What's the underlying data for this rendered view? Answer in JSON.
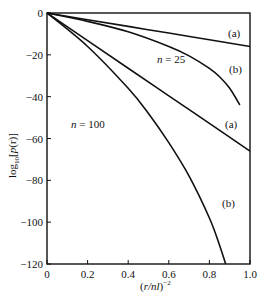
{
  "chart_data": {
    "type": "line",
    "title": "",
    "xlabel": "(r/nl)^-2",
    "xlabel_parts": {
      "open": "(",
      "var": "r/nl",
      "close": ")",
      "sup": "-2"
    },
    "ylabel": "log10[p(r)]",
    "ylabel_parts": {
      "pre": "log",
      "sub": "10",
      "mid": "[",
      "var": "p",
      "args": "(r)",
      "close": "]"
    },
    "xlim": [
      0,
      1.0
    ],
    "ylim": [
      -120,
      0
    ],
    "xticks": [
      0,
      0.2,
      0.4,
      0.6,
      0.8,
      1.0
    ],
    "xtick_labels": [
      "0",
      "0.2",
      "0.4",
      "0.6",
      "0.8",
      "1.0"
    ],
    "yticks": [
      0,
      -20,
      -40,
      -60,
      -80,
      -100,
      -120
    ],
    "ytick_labels": [
      "0",
      "−20",
      "−40",
      "−60",
      "−80",
      "−100",
      "−120"
    ],
    "grid": false,
    "legend": null,
    "series": [
      {
        "name": "n = 25 (a)",
        "group": "n = 25",
        "variant": "(a)",
        "x": [
          0,
          0.2,
          0.4,
          0.6,
          0.8,
          1.0
        ],
        "y": [
          0,
          -3.2,
          -6.4,
          -9.6,
          -12.8,
          -16
        ]
      },
      {
        "name": "n = 25 (b)",
        "group": "n = 25",
        "variant": "(b)",
        "x": [
          0,
          0.2,
          0.4,
          0.6,
          0.7,
          0.8,
          0.85,
          0.9,
          0.95
        ],
        "y": [
          0,
          -4,
          -9,
          -16,
          -20.5,
          -26.5,
          -30.5,
          -36,
          -44
        ]
      },
      {
        "name": "n = 100 (a)",
        "group": "n = 100",
        "variant": "(a)",
        "x": [
          0,
          0.2,
          0.4,
          0.6,
          0.8,
          1.0
        ],
        "y": [
          0,
          -13.2,
          -26.4,
          -39.6,
          -52.8,
          -66
        ]
      },
      {
        "name": "n = 100 (b)",
        "group": "n = 100",
        "variant": "(b)",
        "x": [
          0,
          0.2,
          0.4,
          0.5,
          0.6,
          0.7,
          0.8,
          0.85,
          0.88
        ],
        "y": [
          0,
          -16,
          -36,
          -48,
          -62,
          -78,
          -98,
          -111,
          -120
        ]
      }
    ],
    "annotations": [
      {
        "text": "(a)",
        "x": 0.93,
        "y": -7.5,
        "series": "n = 25 (a)"
      },
      {
        "text": "n = 25",
        "x": 0.62,
        "y": -22,
        "italic_part": "n"
      },
      {
        "text": "(b)",
        "x": 0.93,
        "y": -28,
        "series": "n = 25 (b)"
      },
      {
        "text": "(a)",
        "x": 0.87,
        "y": -58,
        "series": "n = 100 (a)"
      },
      {
        "text": "n = 100",
        "x": 0.25,
        "y": -53,
        "italic_part": "n"
      },
      {
        "text": "(b)",
        "x": 0.76,
        "y": -95,
        "series": "n = 100 (b)"
      }
    ]
  },
  "labels": {
    "ann_25a": "(a)",
    "ann_25_n": "n",
    "ann_25_eq": " = 25",
    "ann_25b": "(b)",
    "ann_100a": "(a)",
    "ann_100_n": "n",
    "ann_100_eq": " = 100",
    "ann_100b": "(b)",
    "x_open": "(",
    "x_var": "r/nl",
    "x_close": ")",
    "x_sup": "−2",
    "y_log": "log",
    "y_sub": "10",
    "y_open": "[",
    "y_p": "p",
    "y_args": "(r)",
    "y_close": "]"
  },
  "colors": {
    "line": "#111111",
    "axis": "#111111",
    "background": "#ffffff"
  }
}
